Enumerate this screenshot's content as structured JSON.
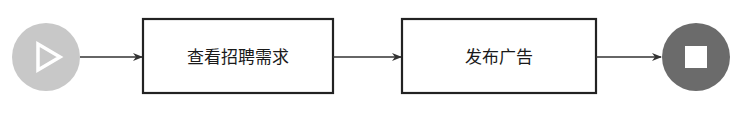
{
  "diagram": {
    "type": "flowchart",
    "direction": "left-to-right",
    "start": {
      "icon": "play-icon",
      "color": "#c8c8c8"
    },
    "steps": [
      {
        "label": "查看招聘需求"
      },
      {
        "label": "发布广告"
      }
    ],
    "end": {
      "icon": "stop-icon",
      "color": "#6b6b6b"
    },
    "edges": [
      {
        "from": "start",
        "to": "step-1"
      },
      {
        "from": "step-1",
        "to": "step-2"
      },
      {
        "from": "step-2",
        "to": "end"
      }
    ]
  }
}
